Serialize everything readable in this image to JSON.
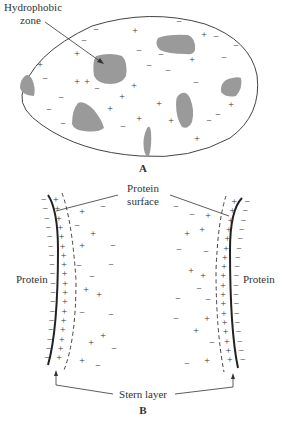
{
  "figure": {
    "panel_a": {
      "label": "A",
      "callout": {
        "line1": "Hydrophobic",
        "line2": "zone"
      },
      "colors": {
        "outline": "#444444",
        "hydrophobic_zone": "#9a9a9a",
        "charge": "#333333"
      },
      "zones": [
        {
          "id": "zone-left-edge",
          "path": "M25,76 Q20,80 20,88 Q22,95 34,96 Q36,88 32,79 Q28,73 25,76 Z"
        },
        {
          "id": "zone-hydrophobic-main",
          "path": "M96,56 Q110,52 122,56 Q128,62 126,76 Q122,84 110,84 Q98,84 94,76 Q92,62 96,56 Z"
        },
        {
          "id": "zone-top-right",
          "path": "M158,38 Q168,34 188,35 Q196,38 195,50 Q194,55 186,54 Q168,54 160,50 Q154,44 158,38 Z"
        },
        {
          "id": "zone-bottom-left",
          "path": "M78,103 Q84,100 94,110 Q102,120 104,128 Q98,133 84,131 Q74,130 72,124 Q72,110 78,103 Z"
        },
        {
          "id": "zone-center-right",
          "path": "M180,94 Q186,90 190,98 Q195,110 192,122 Q188,130 182,127 Q176,118 176,104 Q176,96 180,94 Z"
        },
        {
          "id": "zone-right-edge",
          "path": "M226,80 Q236,76 241,78 Q243,88 236,96 Q226,98 221,92 Q220,84 226,80 Z"
        },
        {
          "id": "zone-bottom-center",
          "path": "M147,128 Q150,124 151,132 Q152,146 149,156 Q146,158 144,150 Q142,138 147,128 Z"
        }
      ],
      "charges": [
        {
          "s": "+",
          "x": 135,
          "y": 34
        },
        {
          "s": "+",
          "x": 204,
          "y": 38
        },
        {
          "s": "+",
          "x": 77,
          "y": 57
        },
        {
          "s": "+",
          "x": 192,
          "y": 63
        },
        {
          "s": "+",
          "x": 40,
          "y": 68
        },
        {
          "s": "+",
          "x": 77,
          "y": 85
        },
        {
          "s": "+",
          "x": 87,
          "y": 85
        },
        {
          "s": "+",
          "x": 134,
          "y": 89
        },
        {
          "s": "+",
          "x": 122,
          "y": 100
        },
        {
          "s": "+",
          "x": 159,
          "y": 107
        },
        {
          "s": "+",
          "x": 231,
          "y": 108
        },
        {
          "s": "+",
          "x": 110,
          "y": 112
        },
        {
          "s": "+",
          "x": 139,
          "y": 122
        },
        {
          "s": "+",
          "x": 171,
          "y": 124
        },
        {
          "s": "+",
          "x": 197,
          "y": 142
        },
        {
          "s": "−",
          "x": 96,
          "y": 33
        },
        {
          "s": "−",
          "x": 179,
          "y": 25
        },
        {
          "s": "−",
          "x": 216,
          "y": 40
        },
        {
          "s": "−",
          "x": 236,
          "y": 49
        },
        {
          "s": "−",
          "x": 84,
          "y": 44
        },
        {
          "s": "−",
          "x": 139,
          "y": 54
        },
        {
          "s": "−",
          "x": 161,
          "y": 58
        },
        {
          "s": "−",
          "x": 224,
          "y": 61
        },
        {
          "s": "−",
          "x": 149,
          "y": 69
        },
        {
          "s": "−",
          "x": 168,
          "y": 74
        },
        {
          "s": "−",
          "x": 45,
          "y": 82
        },
        {
          "s": "−",
          "x": 97,
          "y": 92
        },
        {
          "s": "−",
          "x": 196,
          "y": 86
        },
        {
          "s": "−",
          "x": 61,
          "y": 101
        },
        {
          "s": "−",
          "x": 49,
          "y": 113
        },
        {
          "s": "−",
          "x": 218,
          "y": 118
        },
        {
          "s": "−",
          "x": 209,
          "y": 124
        },
        {
          "s": "−",
          "x": 63,
          "y": 127
        },
        {
          "s": "−",
          "x": 123,
          "y": 130
        }
      ]
    },
    "panel_b": {
      "label": "B",
      "top_label": {
        "line1": "Protein",
        "line2": "surface"
      },
      "left_label": "Protein",
      "right_label": "Protein",
      "bottom_label": "Stern layer",
      "colors": {
        "surface_line": "#222222",
        "stern_boundary": "#444444",
        "charge": "#333333"
      },
      "left_wall_plus_count": 18,
      "right_wall_plus_count": 18,
      "left_diffuse": [
        {
          "s": "+",
          "x": 82,
          "y": 215
        },
        {
          "s": "−",
          "x": 103,
          "y": 210
        },
        {
          "s": "−",
          "x": 77,
          "y": 229
        },
        {
          "s": "+",
          "x": 93,
          "y": 237
        },
        {
          "s": "+",
          "x": 82,
          "y": 249
        },
        {
          "s": "−",
          "x": 113,
          "y": 249
        },
        {
          "s": "−",
          "x": 79,
          "y": 269
        },
        {
          "s": "−",
          "x": 111,
          "y": 268
        },
        {
          "s": "−",
          "x": 92,
          "y": 280
        },
        {
          "s": "+",
          "x": 86,
          "y": 293
        },
        {
          "s": "+",
          "x": 99,
          "y": 298
        },
        {
          "s": "−",
          "x": 82,
          "y": 316
        },
        {
          "s": "−",
          "x": 111,
          "y": 318
        },
        {
          "s": "+",
          "x": 103,
          "y": 339
        },
        {
          "s": "+",
          "x": 91,
          "y": 346
        },
        {
          "s": "−",
          "x": 114,
          "y": 352
        },
        {
          "s": "+",
          "x": 82,
          "y": 364
        },
        {
          "s": "−",
          "x": 98,
          "y": 369
        }
      ],
      "right_diffuse": [
        {
          "s": "−",
          "x": 176,
          "y": 210
        },
        {
          "s": "−",
          "x": 192,
          "y": 218
        },
        {
          "s": "+",
          "x": 208,
          "y": 219
        },
        {
          "s": "+",
          "x": 202,
          "y": 233
        },
        {
          "s": "+",
          "x": 187,
          "y": 237
        },
        {
          "s": "−",
          "x": 179,
          "y": 253
        },
        {
          "s": "−",
          "x": 206,
          "y": 255
        },
        {
          "s": "+",
          "x": 191,
          "y": 274
        },
        {
          "s": "+",
          "x": 203,
          "y": 279
        },
        {
          "s": "−",
          "x": 199,
          "y": 292
        },
        {
          "s": "−",
          "x": 178,
          "y": 302
        },
        {
          "s": "−",
          "x": 208,
          "y": 303
        },
        {
          "s": "−",
          "x": 176,
          "y": 322
        },
        {
          "s": "+",
          "x": 207,
          "y": 322
        },
        {
          "s": "+",
          "x": 196,
          "y": 334
        },
        {
          "s": "−",
          "x": 212,
          "y": 346
        },
        {
          "s": "−",
          "x": 187,
          "y": 367
        },
        {
          "s": "+",
          "x": 207,
          "y": 364
        }
      ]
    }
  }
}
